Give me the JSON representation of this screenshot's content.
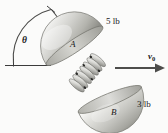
{
  "figure": {
    "background_color": "#fbfbfa"
  },
  "labels": {
    "weight_top": "5 lb",
    "weight_bottom": "3 lb",
    "body_top": "A",
    "body_bottom": "B",
    "angle": "θ",
    "velocity": "v",
    "velocity_subscript": "0"
  },
  "icons": {
    "angle_arc": "angle-arc-icon",
    "spring": "spring-coil-icon",
    "velocity_arrow": "right-arrow-icon",
    "hemisphere_top": "hemisphere-icon",
    "hemisphere_bottom": "hemisphere-icon"
  },
  "colors": {
    "line": "#3d3d3d",
    "body_fill_light": "#f2f2f0",
    "body_fill_mid": "#c9c9c4",
    "body_fill_dark": "#9a9a94",
    "spring": "#5a5a58",
    "text": "#1a1a1a"
  },
  "geometry": {
    "angle_degrees_note": "angle between horizontal reference line and hemisphere axis",
    "velocity_arrow_from_x": 115,
    "velocity_arrow_to_x": 163,
    "velocity_arrow_y": 68
  }
}
